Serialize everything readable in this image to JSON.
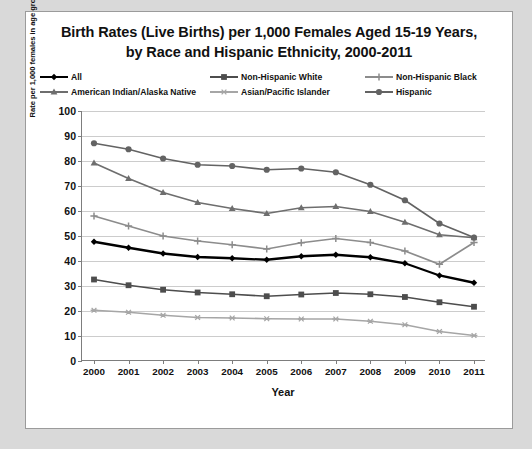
{
  "title": {
    "line1": "Birth Rates (Live Births) per 1,000 Females Aged 15-19 Years,",
    "line2": "by Race and Hispanic Ethnicity, 2000-2011"
  },
  "legend": [
    {
      "label": "All",
      "color": "#000000",
      "marker": "diamond"
    },
    {
      "label": "Non-Hispanic White",
      "color": "#4d4d4d",
      "marker": "square"
    },
    {
      "label": "Non-Hispanic Black",
      "color": "#8c8c8c",
      "marker": "plus"
    },
    {
      "label": "American Indian/Alaska Native",
      "color": "#6e6e6e",
      "marker": "triangle"
    },
    {
      "label": "Asian/Pacific Islander",
      "color": "#a6a6a6",
      "marker": "asterisk"
    },
    {
      "label": "Hispanic",
      "color": "#636363",
      "marker": "circle"
    }
  ],
  "axes": {
    "ylabel": "Rate per 1,000 females in age group for each race and ethnicity",
    "xlabel": "Year",
    "yticks": [
      "0",
      "10",
      "20",
      "30",
      "40",
      "50",
      "60",
      "70",
      "80",
      "90",
      "100"
    ]
  },
  "chart_data": {
    "type": "line",
    "title": "Birth Rates (Live Births) per 1,000 Females Aged 15-19 Years, by Race and Hispanic Ethnicity, 2000-2011",
    "xlabel": "Year",
    "ylabel": "Rate per 1,000 females in age group for each race and ethnicity",
    "categories": [
      "2000",
      "2001",
      "2002",
      "2003",
      "2004",
      "2005",
      "2006",
      "2007",
      "2008",
      "2009",
      "2010",
      "2011"
    ],
    "ylim": [
      0,
      100
    ],
    "ytick_step": 10,
    "grid": true,
    "legend_position": "top",
    "series": [
      {
        "name": "All",
        "color": "#000000",
        "marker": "diamond",
        "values": [
          47.7,
          45.3,
          43.0,
          41.6,
          41.1,
          40.5,
          41.9,
          42.5,
          41.5,
          39.1,
          34.2,
          31.3
        ]
      },
      {
        "name": "Non-Hispanic White",
        "color": "#4d4d4d",
        "marker": "square",
        "values": [
          32.6,
          30.3,
          28.5,
          27.4,
          26.7,
          25.9,
          26.6,
          27.2,
          26.7,
          25.6,
          23.5,
          21.7
        ]
      },
      {
        "name": "Non-Hispanic Black",
        "color": "#8c8c8c",
        "marker": "plus",
        "values": [
          58.0,
          54.0,
          50.0,
          48.0,
          46.5,
          44.8,
          47.3,
          49.0,
          47.4,
          44.0,
          38.7,
          47.4
        ]
      },
      {
        "name": "American Indian/Alaska Native",
        "color": "#6e6e6e",
        "marker": "triangle",
        "values": [
          79.2,
          73.0,
          67.4,
          63.4,
          61.0,
          59.0,
          61.3,
          61.8,
          59.8,
          55.5,
          50.5,
          49.3
        ]
      },
      {
        "name": "Asian/Pacific Islander",
        "color": "#a6a6a6",
        "marker": "asterisk",
        "values": [
          20.3,
          19.5,
          18.3,
          17.4,
          17.2,
          16.9,
          16.8,
          16.8,
          15.9,
          14.5,
          11.8,
          10.2
        ]
      },
      {
        "name": "Hispanic",
        "color": "#636363",
        "marker": "circle",
        "values": [
          87.1,
          84.7,
          81.0,
          78.5,
          78.0,
          76.5,
          77.0,
          75.5,
          70.5,
          64.3,
          55.0,
          49.4
        ]
      }
    ]
  }
}
